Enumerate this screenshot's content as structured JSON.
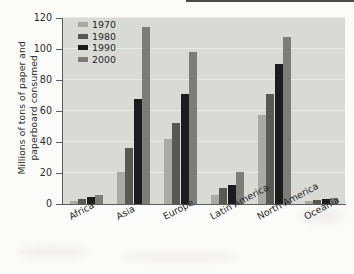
{
  "chart_data": {
    "type": "bar",
    "title": "",
    "xlabel": "",
    "ylabel": "Millions of tons of paper and paperboard consumed",
    "ylabel_lines": [
      "Millions of tons of paper and",
      "paperboard consumed"
    ],
    "ylim": [
      0,
      120
    ],
    "yticks": [
      0,
      20,
      40,
      60,
      80,
      100,
      120
    ],
    "ytick_labels": [
      "0",
      "20",
      "40",
      "60",
      "80",
      "100",
      "120"
    ],
    "grid": true,
    "legend_position": "top-left inside plot",
    "categories": [
      "Africa",
      "Asia",
      "Europe",
      "Latin America",
      "North America",
      "Oceania"
    ],
    "series": [
      {
        "name": "1970",
        "color": "#a9a9a5",
        "values": [
          2.0,
          20.5,
          42.0,
          6.0,
          57.5,
          1.8
        ]
      },
      {
        "name": "1980",
        "color": "#585855",
        "values": [
          3.5,
          36.0,
          52.0,
          10.5,
          71.0,
          2.6
        ]
      },
      {
        "name": "1990",
        "color": "#1c1c1c",
        "values": [
          4.5,
          67.5,
          71.0,
          12.5,
          90.5,
          3.2
        ]
      },
      {
        "name": "2000",
        "color": "#7c7c79",
        "values": [
          5.5,
          114.0,
          98.0,
          20.5,
          108.0,
          4.0
        ]
      }
    ]
  },
  "legend": {
    "items": [
      {
        "label": "1970"
      },
      {
        "label": "1980"
      },
      {
        "label": "1990"
      },
      {
        "label": "2000"
      }
    ]
  }
}
